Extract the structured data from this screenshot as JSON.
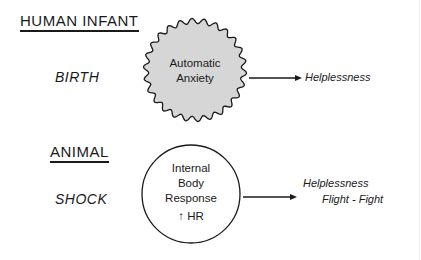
{
  "diagram": {
    "sections": [
      {
        "heading": "HUMAN INFANT",
        "event": "BIRTH",
        "node": {
          "lines": [
            "Automatic",
            "Anxiety"
          ],
          "shape": "wavy-circle",
          "fill": "#d6d6d6"
        },
        "outcome": [
          "Helplessness"
        ]
      },
      {
        "heading": "ANIMAL",
        "event": "SHOCK",
        "node": {
          "lines": [
            "Internal",
            "Body",
            "Response",
            "↑ HR"
          ],
          "shape": "circle",
          "fill": "#ffffff"
        },
        "outcome": [
          "Helplessness",
          "Flight - Fight"
        ]
      }
    ],
    "colors": {
      "ink": "#1a1a1a",
      "blob_fill": "#d6d6d6"
    }
  }
}
